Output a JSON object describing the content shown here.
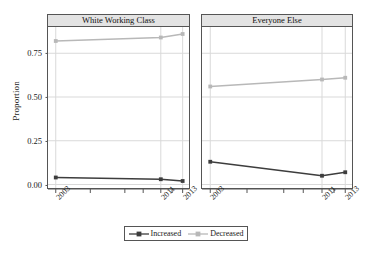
{
  "chart_data": {
    "type": "line",
    "title": "",
    "xlabel": "",
    "ylabel": "Proportion",
    "ylim": [
      -0.02,
      0.9
    ],
    "yticks": [
      "0.00",
      "0.25",
      "0.50",
      "0.75"
    ],
    "ytick_values": [
      0.0,
      0.25,
      0.5,
      0.75
    ],
    "x": [
      2003,
      2011,
      2013
    ],
    "xtick_labels": [
      "2003",
      "2011",
      "2013"
    ],
    "grid": true,
    "legend_position": "bottom",
    "panels": [
      {
        "title": "White Working Class",
        "series": [
          {
            "name": "Increased",
            "values": [
              0.04,
              0.03,
              0.02
            ]
          },
          {
            "name": "Decreased",
            "values": [
              0.82,
              0.84,
              0.86
            ]
          }
        ]
      },
      {
        "title": "Everyone Else",
        "series": [
          {
            "name": "Increased",
            "values": [
              0.13,
              0.05,
              0.07
            ]
          },
          {
            "name": "Decreased",
            "values": [
              0.56,
              0.6,
              0.61
            ]
          }
        ]
      }
    ],
    "legend": [
      {
        "label": "Increased",
        "color": "#3d3d3d"
      },
      {
        "label": "Decreased",
        "color": "#b8b8b8"
      }
    ],
    "colors": {
      "increased": "#3d3d3d",
      "decreased": "#b8b8b8",
      "grid": "#d9d9d9",
      "axis": "#555555",
      "panel_header_bg": "#e3e3e3",
      "text": "#1a1a1a"
    }
  }
}
